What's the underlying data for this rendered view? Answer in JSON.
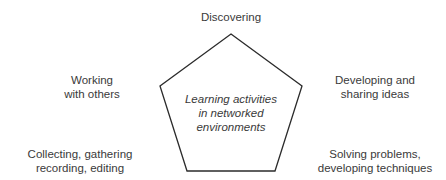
{
  "diagram": {
    "center_label": [
      "Learning activities",
      "in networked",
      "environments"
    ],
    "nodes": [
      {
        "id": "top",
        "lines": [
          "Discovering"
        ]
      },
      {
        "id": "upper-left",
        "lines": [
          "Working",
          "with others"
        ]
      },
      {
        "id": "upper-right",
        "lines": [
          "Developing and",
          "sharing ideas"
        ]
      },
      {
        "id": "lower-left",
        "lines": [
          "Collecting, gathering",
          "recording, editing"
        ]
      },
      {
        "id": "lower-right",
        "lines": [
          "Solving problems,",
          "developing techniques"
        ]
      }
    ],
    "shape": "pentagon",
    "stroke_color": "#2b2b2b",
    "text_color": "#3a3a3a"
  }
}
